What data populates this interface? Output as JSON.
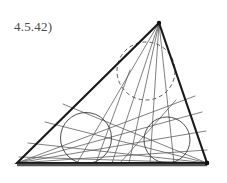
{
  "figure": {
    "label": "4.5.42)",
    "label_color": "#4a4a4a",
    "background_color": "#ffffff",
    "width": 227,
    "height": 183
  },
  "chart_data": {
    "type": "diagram",
    "title": "4.5.42)",
    "xlabel": "",
    "ylabel": "",
    "triangle": {
      "stroke": "#1a1a1a",
      "stroke_width": 2.1,
      "vertices": [
        {
          "name": "bottom-left",
          "x": 17,
          "y": 163
        },
        {
          "name": "apex",
          "x": 159,
          "y": 23
        },
        {
          "name": "bottom-right",
          "x": 207,
          "y": 163
        }
      ]
    },
    "base_line": {
      "stroke": "#555555",
      "stroke_width": 2.4,
      "x1": 17,
      "y1": 165,
      "x2": 207,
      "y2": 165
    },
    "circles": [
      {
        "name": "left-circle",
        "cx": 86,
        "cy": 138,
        "r": 25.5,
        "dashed": false,
        "stroke": "#3c3c3c",
        "stroke_width": 0.9
      },
      {
        "name": "right-circle",
        "cx": 167,
        "cy": 140,
        "r": 23,
        "dashed": false,
        "stroke": "#3c3c3c",
        "stroke_width": 0.9
      },
      {
        "name": "apex-dashed-circle",
        "cx": 146,
        "cy": 71,
        "r": 29,
        "dashed": true,
        "stroke": "#4a4a4a",
        "stroke_width": 0.9
      }
    ],
    "cevians": [
      {
        "name": "apex-cevian-1",
        "x1": 159,
        "y1": 23,
        "x2": 77,
        "y2": 163
      },
      {
        "name": "apex-cevian-2",
        "x1": 159,
        "y1": 23,
        "x2": 112,
        "y2": 163
      },
      {
        "name": "apex-cevian-3",
        "x1": 159,
        "y1": 23,
        "x2": 129,
        "y2": 163
      },
      {
        "name": "apex-cevian-4",
        "x1": 159,
        "y1": 23,
        "x2": 150,
        "y2": 163
      },
      {
        "name": "apex-cevian-5",
        "x1": 159,
        "y1": 23,
        "x2": 174,
        "y2": 163
      },
      {
        "name": "bl-cevian-1",
        "x1": 17,
        "y1": 163,
        "x2": 195,
        "y2": 96
      },
      {
        "name": "bl-cevian-2",
        "x1": 17,
        "y1": 163,
        "x2": 202,
        "y2": 112
      },
      {
        "name": "bl-cevian-3",
        "x1": 17,
        "y1": 163,
        "x2": 206,
        "y2": 131
      },
      {
        "name": "bl-cevian-4",
        "x1": 17,
        "y1": 163,
        "x2": 207,
        "y2": 150
      },
      {
        "name": "br-cevian-1",
        "x1": 207,
        "y1": 163,
        "x2": 63,
        "y2": 104
      },
      {
        "name": "br-cevian-2",
        "x1": 207,
        "y1": 163,
        "x2": 45,
        "y2": 122
      },
      {
        "name": "br-cevian-3",
        "x1": 207,
        "y1": 163,
        "x2": 28,
        "y2": 143
      },
      {
        "name": "br-cevian-4",
        "x1": 207,
        "y1": 163,
        "x2": 19,
        "y2": 157
      },
      {
        "name": "cross-chord-1",
        "x1": 130,
        "y1": 70,
        "x2": 96,
        "y2": 163
      },
      {
        "name": "cross-chord-2",
        "x1": 176,
        "y1": 100,
        "x2": 120,
        "y2": 163
      }
    ],
    "cevian_stroke": "#555555",
    "cevian_stroke_width": 0.75
  }
}
